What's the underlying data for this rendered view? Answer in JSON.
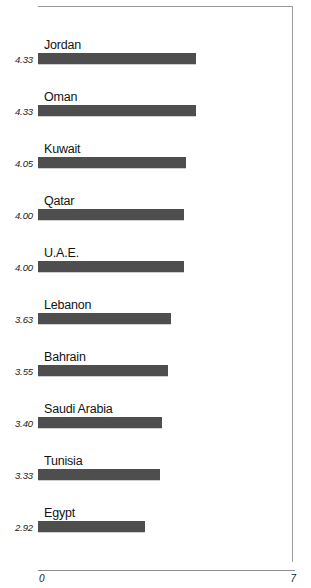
{
  "chart_data": {
    "type": "bar",
    "orientation": "horizontal",
    "title": "",
    "subtitle": "",
    "xlabel": "",
    "ylabel": "",
    "xlim": [
      0,
      7
    ],
    "axis_ticks": [
      "0",
      "7"
    ],
    "grid": false,
    "legend": null,
    "bar_color": "#4e4e4e",
    "categories": [
      "Jordan",
      "Oman",
      "Kuwait",
      "Qatar",
      "U.A.E.",
      "Lebanon",
      "Bahrain",
      "Saudi Arabia",
      "Tunisia",
      "Egypt"
    ],
    "values": [
      4.33,
      4.33,
      4.05,
      4.0,
      4.0,
      3.63,
      3.55,
      3.4,
      3.33,
      2.92
    ],
    "value_labels": [
      "4.33",
      "4.33",
      "4.05",
      "4.00",
      "4.00",
      "3.63",
      "3.55",
      "3.40",
      "3.33",
      "2.92"
    ],
    "bars": [
      {
        "label": "Jordan",
        "value": 4.33,
        "value_label": "4.33"
      },
      {
        "label": "Oman",
        "value": 4.33,
        "value_label": "4.33"
      },
      {
        "label": "Kuwait",
        "value": 4.05,
        "value_label": "4.05"
      },
      {
        "label": "Qatar",
        "value": 4.0,
        "value_label": "4.00"
      },
      {
        "label": "U.A.E.",
        "value": 4.0,
        "value_label": "4.00"
      },
      {
        "label": "Lebanon",
        "value": 3.63,
        "value_label": "3.63"
      },
      {
        "label": "Bahrain",
        "value": 3.55,
        "value_label": "3.55"
      },
      {
        "label": "Saudi Arabia",
        "value": 3.4,
        "value_label": "3.40"
      },
      {
        "label": "Tunisia",
        "value": 3.33,
        "value_label": "3.33"
      },
      {
        "label": "Egypt",
        "value": 2.92,
        "value_label": "2.92"
      }
    ]
  },
  "axis": {
    "min_label": "0",
    "max_label": "7"
  }
}
